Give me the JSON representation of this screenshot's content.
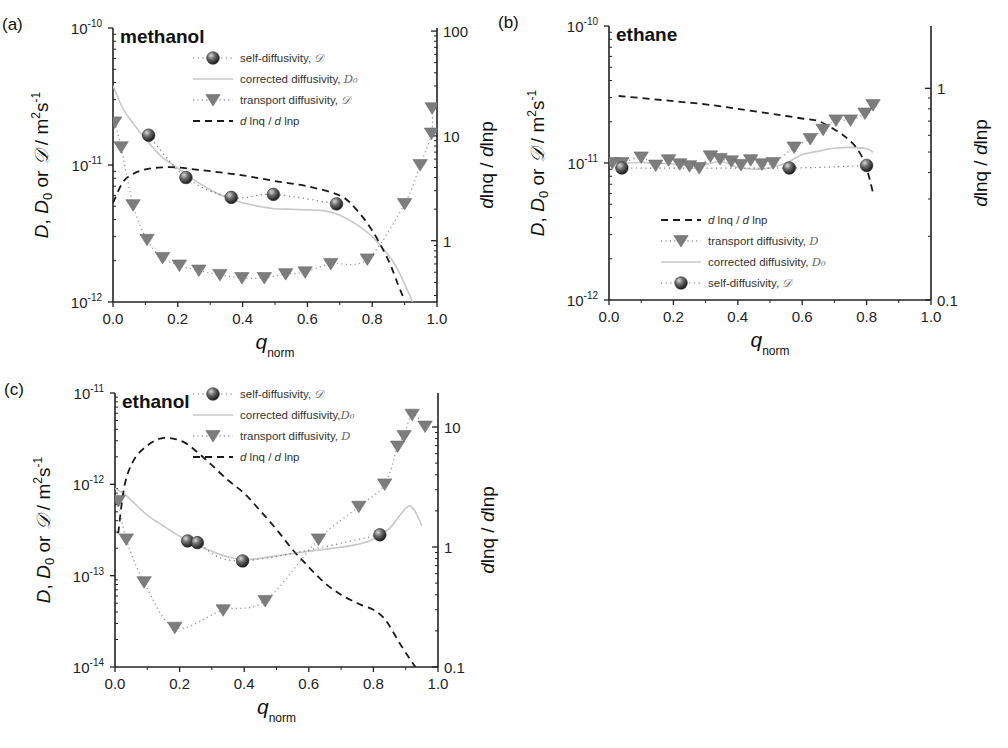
{
  "figure": {
    "width": 1008,
    "height": 748
  },
  "colors": {
    "self": "#3a3a3a",
    "self_highlight": "#d8d8d8",
    "transport": "#7d7d7d",
    "corrected": "#c8c8c8",
    "dlnq": "#1a1a1a",
    "axis": "#222222"
  },
  "chart_data": [
    {
      "panel": "(a)",
      "title": "methanol",
      "type": "scatter",
      "xlabel": "q_norm",
      "xlabel_main": "q",
      "xlabel_sub": "norm",
      "ylabel_left": "D, D0 or 𝒟 / m2s-1",
      "ylabel_right": "dlnq / dlnp",
      "xlim": [
        0.0,
        1.0
      ],
      "ylim_left": [
        1e-12,
        1e-10
      ],
      "ylim_right": [
        0.26,
        107
      ],
      "yscale": "log",
      "xticks": [
        "0.0",
        "0.2",
        "0.4",
        "0.6",
        "0.8",
        "1.0"
      ],
      "yticks_left": [
        {
          "base": "10",
          "exp": "-10",
          "value": 1e-10
        },
        {
          "base": "10",
          "exp": "-11",
          "value": 1e-11
        },
        {
          "base": "10",
          "exp": "-12",
          "value": 1e-12
        }
      ],
      "yticks_right": [
        {
          "label": "100",
          "value": 100
        },
        {
          "label": "10",
          "value": 10
        },
        {
          "label": "1",
          "value": 1
        }
      ],
      "box": {
        "x0": 113,
        "x1": 437,
        "ytop": 28,
        "ybot": 302
      },
      "legend": {
        "x": 218,
        "y": 58,
        "entries": [
          {
            "label": "self-diffusivity, ",
            "symbol": "𝒟",
            "kind": "self"
          },
          {
            "label": "corrected diffusivity, ",
            "symbol": "D₀",
            "kind": "corrected"
          },
          {
            "label": "transport diffusivity, ",
            "symbol": "𝒟",
            "kind": "transport"
          },
          {
            "label": "",
            "symbol": "d lnq / d lnp",
            "kind": "dlnq"
          }
        ]
      },
      "series": [
        {
          "name": "self-diffusivity",
          "kind": "self",
          "axis": "left",
          "x": [
            0.11,
            0.225,
            0.365,
            0.495,
            0.69
          ],
          "y": [
            1.65e-11,
            8.1e-12,
            5.8e-12,
            6.1e-12,
            5.2e-12
          ]
        },
        {
          "name": "transport diffusivity",
          "kind": "transport",
          "axis": "left",
          "x": [
            0.005,
            0.025,
            0.062,
            0.105,
            0.153,
            0.205,
            0.265,
            0.33,
            0.398,
            0.467,
            0.533,
            0.593,
            0.672,
            0.785,
            0.9,
            0.948,
            0.983,
            0.985
          ],
          "y": [
            2.05e-11,
            1.35e-11,
            5.1e-12,
            2.85e-12,
            2.1e-12,
            1.85e-12,
            1.7e-12,
            1.58e-12,
            1.5e-12,
            1.5e-12,
            1.6e-12,
            1.65e-12,
            1.9e-12,
            2.05e-12,
            5.2e-12,
            1e-11,
            1.7e-11,
            2.6e-11
          ]
        },
        {
          "name": "corrected diffusivity",
          "kind": "corrected",
          "axis": "left",
          "x": [
            0.0,
            0.03,
            0.06,
            0.1,
            0.15,
            0.2,
            0.25,
            0.3,
            0.35,
            0.4,
            0.45,
            0.5,
            0.55,
            0.6,
            0.65,
            0.7,
            0.75,
            0.8,
            0.85,
            0.88,
            0.91,
            0.925
          ],
          "y": [
            3.8e-11,
            2.6e-11,
            2.05e-11,
            1.55e-11,
            1.15e-11,
            9.5e-12,
            7.8e-12,
            6.6e-12,
            5.8e-12,
            5.3e-12,
            5e-12,
            4.8e-12,
            4.75e-12,
            4.7e-12,
            4.65e-12,
            4.3e-12,
            3.7e-12,
            3e-12,
            2.2e-12,
            1.7e-12,
            1.2e-12,
            1e-12
          ]
        },
        {
          "name": "dlnq/dlnp",
          "kind": "dlnq",
          "axis": "right",
          "x": [
            0.0,
            0.03,
            0.06,
            0.1,
            0.15,
            0.2,
            0.25,
            0.3,
            0.4,
            0.5,
            0.6,
            0.7,
            0.75,
            0.8,
            0.85,
            0.88,
            0.9
          ],
          "y": [
            2.3,
            3.6,
            4.3,
            4.8,
            5.0,
            5.0,
            4.8,
            4.6,
            4.2,
            3.7,
            3.3,
            2.7,
            2.0,
            1.25,
            0.65,
            0.38,
            0.27
          ]
        }
      ]
    },
    {
      "panel": "(b)",
      "title": "ethane",
      "type": "scatter",
      "xlabel": "q_norm",
      "xlabel_main": "q",
      "xlabel_sub": "norm",
      "ylabel_left": "D, D0 or 𝒟 / m2s-1",
      "ylabel_right": "dlnq / dlnp",
      "xlim": [
        0.0,
        1.0
      ],
      "ylim_left": [
        1e-12,
        1e-10
      ],
      "ylim_right": [
        0.1,
        1.97
      ],
      "yscale": "log",
      "xticks": [
        "0.0",
        "0.2",
        "0.4",
        "0.6",
        "0.8",
        "1.0"
      ],
      "yticks_left": [
        {
          "base": "10",
          "exp": "-10",
          "value": 1e-10
        },
        {
          "base": "10",
          "exp": "-11",
          "value": 1e-11
        },
        {
          "base": "10",
          "exp": "-12",
          "value": 1e-12
        }
      ],
      "yticks_right": [
        {
          "label": "1",
          "value": 1
        },
        {
          "label": "0.1",
          "value": 0.1
        }
      ],
      "box": {
        "x0": 609,
        "x1": 931,
        "ytop": 26,
        "ybot": 300
      },
      "legend": {
        "x": 686,
        "y": 220,
        "entries": [
          {
            "label": "",
            "symbol": "d lnq / d lnp",
            "kind": "dlnq"
          },
          {
            "label": "transport diffusivity, ",
            "symbol": "D",
            "kind": "transport"
          },
          {
            "label": "corrected diffusivity, ",
            "symbol": "D₀",
            "kind": "corrected"
          },
          {
            "label": "self-diffusivity, ",
            "symbol": "𝒟",
            "kind": "self"
          }
        ]
      },
      "series": [
        {
          "name": "self-diffusivity",
          "kind": "self",
          "axis": "left",
          "x": [
            0.04,
            0.56,
            0.8
          ],
          "y": [
            9.2e-12,
            9.2e-12,
            9.6e-12
          ]
        },
        {
          "name": "transport diffusivity",
          "kind": "transport",
          "axis": "left",
          "x": [
            0.01,
            0.04,
            0.1,
            0.145,
            0.185,
            0.22,
            0.25,
            0.28,
            0.315,
            0.345,
            0.38,
            0.41,
            0.44,
            0.475,
            0.51,
            0.575,
            0.625,
            0.665,
            0.705,
            0.75,
            0.795,
            0.82
          ],
          "y": [
            1e-11,
            1e-11,
            1.1e-11,
            9.6e-12,
            1.05e-11,
            9.8e-12,
            9.5e-12,
            9.2e-12,
            1.12e-11,
            1.07e-11,
            1.03e-11,
            9.7e-12,
            1.05e-11,
            9.8e-12,
            1e-11,
            1.3e-11,
            1.5e-11,
            1.75e-11,
            2.05e-11,
            2.05e-11,
            2.3e-11,
            2.65e-11
          ]
        },
        {
          "name": "corrected diffusivity",
          "kind": "corrected",
          "axis": "left",
          "x": [
            0.0,
            0.05,
            0.1,
            0.15,
            0.2,
            0.25,
            0.3,
            0.35,
            0.4,
            0.45,
            0.5,
            0.55,
            0.6,
            0.65,
            0.7,
            0.75,
            0.8,
            0.82
          ],
          "y": [
            1.02e-11,
            1e-11,
            1.01e-11,
            1e-11,
            9.8e-12,
            9.6e-12,
            9.8e-12,
            1.02e-11,
            9.3e-12,
            9e-12,
            9.2e-12,
            1e-11,
            1.15e-11,
            1.22e-11,
            1.28e-11,
            1.3e-11,
            1.27e-11,
            1.2e-11
          ]
        },
        {
          "name": "dlnq/dlnp",
          "kind": "dlnq",
          "axis": "right",
          "x": [
            0.03,
            0.1,
            0.2,
            0.3,
            0.4,
            0.5,
            0.55,
            0.6,
            0.65,
            0.7,
            0.74,
            0.77,
            0.79,
            0.8,
            0.81,
            0.82
          ],
          "y": [
            0.92,
            0.9,
            0.87,
            0.84,
            0.8,
            0.76,
            0.74,
            0.72,
            0.7,
            0.64,
            0.58,
            0.52,
            0.46,
            0.42,
            0.37,
            0.32
          ]
        }
      ]
    },
    {
      "panel": "(c)",
      "title": "ethanol",
      "type": "scatter",
      "xlabel": "q_norm",
      "xlabel_main": "q",
      "xlabel_sub": "norm",
      "ylabel_left": "D, D0 or 𝒟 / m2s-1",
      "ylabel_right": "dlnq / dlnp",
      "xlim": [
        0.0,
        1.0
      ],
      "ylim_left": [
        1e-14,
        1e-11
      ],
      "ylim_right": [
        0.1,
        19.2
      ],
      "yscale": "log",
      "xticks": [
        "0.0",
        "0.2",
        "0.4",
        "0.6",
        "0.8",
        "1.0"
      ],
      "yticks_left": [
        {
          "base": "10",
          "exp": "-11",
          "value": 1e-11
        },
        {
          "base": "10",
          "exp": "-12",
          "value": 1e-12
        },
        {
          "base": "10",
          "exp": "-13",
          "value": 1e-13
        },
        {
          "base": "10",
          "exp": "-14",
          "value": 1e-14
        }
      ],
      "yticks_right": [
        {
          "label": "10",
          "value": 10
        },
        {
          "label": "1",
          "value": 1
        },
        {
          "label": "0.1",
          "value": 0.1
        }
      ],
      "box": {
        "x0": 115,
        "x1": 438,
        "ytop": 393,
        "ybot": 667
      },
      "legend": {
        "x": 218,
        "y": 394,
        "entries": [
          {
            "label": "self-diffusivity, ",
            "symbol": "𝒟",
            "kind": "self"
          },
          {
            "label": "corrected diffusivity,",
            "symbol": "D₀",
            "kind": "corrected"
          },
          {
            "label": "transport diffusivity, ",
            "symbol": "D",
            "kind": "transport"
          },
          {
            "label": "",
            "symbol": "d lnq / d lnp",
            "kind": "dlnq"
          }
        ]
      },
      "series": [
        {
          "name": "self-diffusivity",
          "kind": "self",
          "axis": "left",
          "x": [
            0.225,
            0.255,
            0.395,
            0.82
          ],
          "y": [
            2.4e-13,
            2.3e-13,
            1.45e-13,
            2.8e-13
          ]
        },
        {
          "name": "transport diffusivity",
          "kind": "transport",
          "axis": "left",
          "x": [
            0.01,
            0.035,
            0.09,
            0.185,
            0.335,
            0.465,
            0.63,
            0.755,
            0.835,
            0.875,
            0.895,
            0.92,
            0.96
          ],
          "y": [
            6.6e-13,
            2.5e-13,
            8.5e-14,
            2.7e-14,
            4.2e-14,
            5.3e-14,
            2.5e-13,
            5.7e-13,
            1e-12,
            2.6e-12,
            3.4e-12,
            5.8e-12,
            4.3e-12
          ]
        },
        {
          "name": "corrected diffusivity",
          "kind": "corrected",
          "axis": "left",
          "x": [
            0.0,
            0.03,
            0.06,
            0.1,
            0.15,
            0.2,
            0.25,
            0.3,
            0.35,
            0.4,
            0.45,
            0.5,
            0.55,
            0.6,
            0.65,
            0.7,
            0.75,
            0.8,
            0.85,
            0.88,
            0.91,
            0.93,
            0.95
          ],
          "y": [
            9e-13,
            7.8e-13,
            6.2e-13,
            4.6e-13,
            3.5e-13,
            2.7e-13,
            2.2e-13,
            1.85e-13,
            1.6e-13,
            1.5e-13,
            1.55e-13,
            1.65e-13,
            1.75e-13,
            1.85e-13,
            1.95e-13,
            2.05e-13,
            2.2e-13,
            2.5e-13,
            3.3e-13,
            4.5e-13,
            5.8e-13,
            5e-13,
            3.5e-13
          ]
        },
        {
          "name": "dlnq/dlnp",
          "kind": "dlnq",
          "axis": "right",
          "x": [
            0.01,
            0.03,
            0.06,
            0.1,
            0.14,
            0.18,
            0.22,
            0.26,
            0.3,
            0.35,
            0.4,
            0.45,
            0.5,
            0.55,
            0.6,
            0.65,
            0.7,
            0.75,
            0.8,
            0.83,
            0.85,
            0.88,
            0.91,
            0.93
          ],
          "y": [
            1.3,
            3.3,
            5.4,
            7.0,
            8.0,
            8.0,
            7.3,
            6.0,
            4.8,
            3.6,
            2.8,
            2.0,
            1.4,
            0.95,
            0.68,
            0.5,
            0.4,
            0.34,
            0.3,
            0.26,
            0.22,
            0.16,
            0.12,
            0.1
          ]
        }
      ]
    }
  ]
}
